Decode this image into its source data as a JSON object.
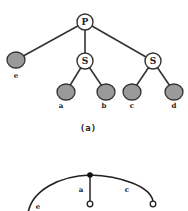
{
  "figure_a": {
    "caption": "(a)",
    "nodes": {
      "root": {
        "label": "P"
      },
      "s_left": {
        "label": "S"
      },
      "s_right": {
        "label": "S"
      }
    },
    "leaves": [
      {
        "label": "e"
      },
      {
        "label": "a"
      },
      {
        "label": "b"
      },
      {
        "label": "c"
      },
      {
        "label": "d"
      }
    ]
  },
  "figure_b": {
    "edge_labels": [
      {
        "label": "a"
      },
      {
        "label": "c"
      },
      {
        "label": "e"
      }
    ]
  },
  "colors": {
    "leaf_fill": "#9a9a9a",
    "stroke": "#333333",
    "background": "#ffffff"
  }
}
